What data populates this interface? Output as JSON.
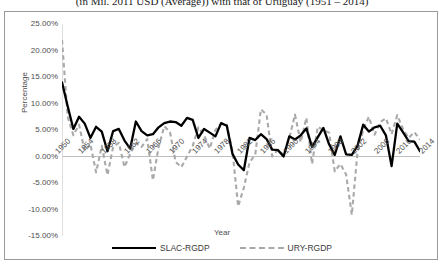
{
  "caption": "(in Mil. 2011 USD (Average)) with that of Uruguay (1951 – 2014)",
  "axis": {
    "ylabel": "Percentage",
    "xlabel": "Year"
  },
  "legend": [
    {
      "label": "SLAC-RGDP",
      "style": "solid",
      "color": "#000000"
    },
    {
      "label": "URY-RGDP",
      "style": "dashed",
      "color": "#a9a9a9"
    }
  ],
  "chart_data": {
    "type": "line",
    "title": "(in Mil. 2011 USD (Average)) with that of Uruguay (1951 – 2014)",
    "xlabel": "Year",
    "ylabel": "Percentage",
    "grid": false,
    "legend_position": "bottom",
    "ylim": [
      -15,
      25
    ],
    "ytick_labels": [
      "25.00%",
      "20.00%",
      "15.00%",
      "10.00%",
      "5.00%",
      "0.00%",
      "-5.00%",
      "-10.00%",
      "-15.00%"
    ],
    "ytick_values": [
      25,
      20,
      15,
      10,
      5,
      0,
      -5,
      -10,
      -15
    ],
    "xlim": [
      1951,
      2014
    ],
    "xtick_labels": [
      "1950",
      "1954",
      "1958",
      "1962",
      "1966",
      "1970",
      "1974",
      "1978",
      "1982",
      "1986",
      "1990",
      "1994",
      "1998",
      "2002",
      "2006",
      "2010",
      "2014"
    ],
    "xtick_values": [
      1950,
      1954,
      1958,
      1962,
      1966,
      1970,
      1974,
      1978,
      1982,
      1986,
      1990,
      1994,
      1998,
      2002,
      2006,
      2010,
      2014
    ],
    "x": [
      1951,
      1952,
      1953,
      1954,
      1955,
      1956,
      1957,
      1958,
      1959,
      1960,
      1961,
      1962,
      1963,
      1964,
      1965,
      1966,
      1967,
      1968,
      1969,
      1970,
      1971,
      1972,
      1973,
      1974,
      1975,
      1976,
      1977,
      1978,
      1979,
      1980,
      1981,
      1982,
      1983,
      1984,
      1985,
      1986,
      1987,
      1988,
      1989,
      1990,
      1991,
      1992,
      1993,
      1994,
      1995,
      1996,
      1997,
      1998,
      1999,
      2000,
      2001,
      2002,
      2003,
      2004,
      2005,
      2006,
      2007,
      2008,
      2009,
      2010,
      2011,
      2012,
      2013,
      2014
    ],
    "series": [
      {
        "name": "SLAC-RGDP",
        "style": "solid",
        "color": "#000000",
        "values": [
          14.0,
          9.5,
          5.2,
          7.5,
          6.2,
          3.5,
          5.6,
          4.7,
          1.0,
          4.8,
          5.2,
          3.0,
          1.5,
          6.6,
          4.8,
          4.0,
          4.2,
          5.5,
          6.3,
          6.6,
          6.5,
          5.8,
          7.3,
          6.9,
          3.5,
          5.2,
          4.5,
          3.8,
          6.3,
          5.8,
          0.5,
          -1.5,
          -2.6,
          3.5,
          3.1,
          4.2,
          3.3,
          1.3,
          1.2,
          0.0,
          3.8,
          3.2,
          4.0,
          5.3,
          1.8,
          3.6,
          5.4,
          2.3,
          0.3,
          3.8,
          0.4,
          0.3,
          2.0,
          6.0,
          4.7,
          5.5,
          5.8,
          4.0,
          -1.8,
          6.2,
          4.6,
          2.9,
          2.8,
          1.0
        ]
      },
      {
        "name": "URY-RGDP",
        "style": "dashed",
        "color": "#a9a9a9",
        "values": [
          22.0,
          7.5,
          4.0,
          6.0,
          1.0,
          2.3,
          -3.0,
          2.0,
          -3.5,
          1.8,
          2.6,
          -2.0,
          0.5,
          2.5,
          1.8,
          3.3,
          -4.5,
          1.8,
          5.7,
          4.6,
          -1.0,
          -2.0,
          0.0,
          2.0,
          5.5,
          4.0,
          1.5,
          5.0,
          6.2,
          6.0,
          1.0,
          -9.4,
          -5.9,
          -1.1,
          0.3,
          8.9,
          7.9,
          0.0,
          1.3,
          0.3,
          3.5,
          7.9,
          2.7,
          7.3,
          -1.4,
          5.6,
          5.0,
          4.5,
          -2.8,
          -1.4,
          -3.4,
          -11.0,
          0.8,
          5.0,
          7.5,
          4.1,
          6.5,
          7.2,
          4.2,
          7.8,
          5.2,
          3.5,
          4.6,
          3.2
        ]
      }
    ]
  }
}
